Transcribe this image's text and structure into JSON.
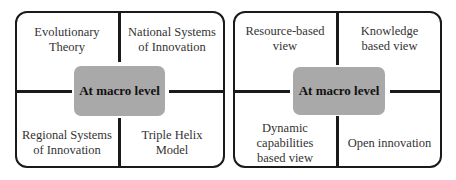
{
  "panels": [
    {
      "center_label": "At macro level",
      "quadrants": {
        "top_left": "Evolutionary Theory",
        "top_right": "National Systems of Innovation",
        "bottom_left": "Regional Systems of Innovation",
        "bottom_right": "Triple Helix Model"
      }
    },
    {
      "center_label": "At macro level",
      "quadrants": {
        "top_left": "Resource-based view",
        "top_right": "Knowledge based view",
        "bottom_left": "Dynamic capabilities based view",
        "bottom_right": "Open innovation"
      }
    }
  ]
}
